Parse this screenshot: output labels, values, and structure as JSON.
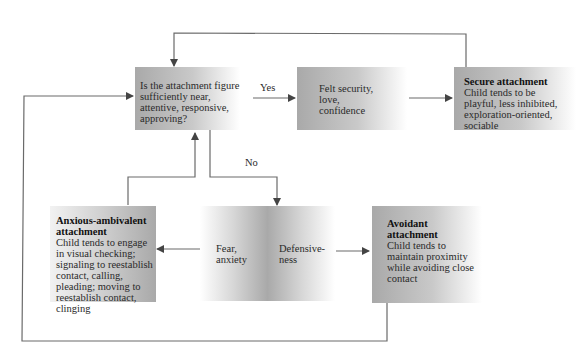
{
  "diagram": {
    "question_box": {
      "text": "Is the attachment figure sufficiently near, attentive, responsive, approving?"
    },
    "yes_label": "Yes",
    "no_label": "No",
    "felt_security_box": {
      "lines": [
        "Felt security,",
        "love,",
        "confidence"
      ]
    },
    "secure_box": {
      "title": "Secure attachment",
      "text": "Child tends to be playful, less inhibited, exploration-oriented, sociable"
    },
    "anxious_box": {
      "title": "Anxious-ambivalent attachment",
      "text": "Child tends to engage in visual checking; signaling to reestablish contact, calling, pleading; moving to reestablish contact, clinging"
    },
    "middle_box": {
      "left_lines": [
        "Fear,",
        "anxiety"
      ],
      "right_lines": [
        "Defensive-",
        "ness"
      ]
    },
    "avoidant_box": {
      "title": "Avoidant attachment",
      "text": "Child tends to maintain proximity while avoiding close contact"
    },
    "colors": {
      "box_gray": "#a9a9a9",
      "line": "#666666",
      "arrow": "#444444"
    }
  }
}
